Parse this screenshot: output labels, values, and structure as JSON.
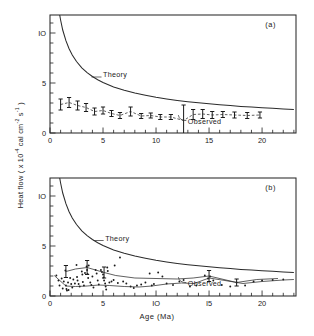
{
  "figure": {
    "ylabel_text": "Heat flow ( x 10",
    "ylabel_exp1": "-4",
    "ylabel_mid": " cal cm",
    "ylabel_exp2": "-2",
    "ylabel_mid2": " s",
    "ylabel_exp3": "-1",
    "ylabel_end": " )",
    "ylabel_full": "Heat flow ( x 10-4 cal cm-2 s-1 )",
    "xlabel": "Age (Ma)",
    "caption": ""
  },
  "chart_data": [
    {
      "type": "line",
      "panel_label": "(a)",
      "title": "",
      "xlabel": "Age (Ma)",
      "ylabel": "Heat flow ( x 10^-4 cal cm^-2 s^-1 )",
      "xlim": [
        0,
        23.2
      ],
      "ylim": [
        0,
        11.8
      ],
      "xticks": [
        0,
        5,
        10,
        15,
        20
      ],
      "xtick_labels": [
        "0",
        "5",
        "10",
        "15",
        "20"
      ],
      "xminor_step": 1,
      "yticks": [
        0,
        5,
        10
      ],
      "ytick_labels": [
        "0",
        "5",
        "IO"
      ],
      "yminor_step": 1,
      "grid": false,
      "legend_position": "inline-annotation",
      "annotations": [
        {
          "text": "Theory",
          "x": 5.0,
          "y": 5.6
        },
        {
          "text": "Observed",
          "x": 13.0,
          "y": 0.95
        },
        {
          "text": "(a)",
          "x": 20.8,
          "y": 10.6
        }
      ],
      "series": [
        {
          "name": "Theory",
          "kind": "curve",
          "note": "half-space cooling q = 11.3 / sqrt(t)",
          "coefficient": 11.3,
          "x": [
            0.9,
            1.0,
            1.2,
            1.5,
            1.8,
            2.1,
            2.5,
            3.0,
            3.5,
            4.0,
            4.5,
            5.0,
            6.0,
            7.0,
            8.0,
            9.0,
            10.0,
            11.0,
            12.0,
            13.0,
            14.0,
            15.0,
            16.0,
            17.0,
            18.0,
            19.0,
            20.0,
            21.0,
            22.0,
            23.0
          ],
          "y": [
            11.9,
            11.3,
            10.3,
            9.23,
            8.43,
            7.8,
            7.15,
            6.52,
            6.04,
            5.65,
            5.33,
            5.05,
            4.61,
            4.27,
            3.99,
            3.77,
            3.57,
            3.41,
            3.26,
            3.13,
            3.02,
            2.92,
            2.83,
            2.74,
            2.66,
            2.59,
            2.53,
            2.47,
            2.41,
            2.36
          ]
        },
        {
          "name": "Observed",
          "kind": "errorbar-line",
          "x": [
            1.0,
            1.8,
            2.6,
            3.4,
            4.2,
            5.0,
            5.8,
            6.6,
            7.6,
            8.6,
            9.5,
            10.4,
            11.4,
            12.6,
            13.5,
            14.4,
            15.3,
            16.3,
            17.4,
            18.6,
            19.8
          ],
          "y": [
            2.85,
            3.05,
            2.75,
            2.55,
            2.15,
            2.25,
            1.95,
            1.75,
            2.15,
            1.7,
            1.75,
            1.6,
            1.6,
            1.25,
            1.85,
            1.9,
            1.8,
            1.85,
            1.8,
            1.75,
            1.8
          ],
          "yerr": [
            0.55,
            0.5,
            0.45,
            0.4,
            0.35,
            0.35,
            0.3,
            0.3,
            0.45,
            0.25,
            0.25,
            0.25,
            0.25,
            1.55,
            0.5,
            0.45,
            0.35,
            0.3,
            0.3,
            0.3,
            0.3
          ]
        }
      ]
    },
    {
      "type": "scatter",
      "panel_label": "(b)",
      "title": "",
      "xlabel": "Age (Ma)",
      "ylabel": "Heat flow ( x 10^-4 cal cm^-2 s^-1 )",
      "xlim": [
        0,
        23.2
      ],
      "ylim": [
        0,
        11.8
      ],
      "xticks": [
        0,
        5,
        10,
        15,
        20
      ],
      "xtick_labels": [
        "0",
        "5",
        "IO",
        "I5",
        "20"
      ],
      "xminor_step": 1,
      "yticks": [
        0,
        5,
        10
      ],
      "ytick_labels": [
        "0",
        "5",
        "IO"
      ],
      "yminor_step": 1,
      "grid": false,
      "legend_position": "inline-annotation",
      "annotations": [
        {
          "text": "Theory",
          "x": 5.2,
          "y": 5.55
        },
        {
          "text": "Observed",
          "x": 13.0,
          "y": 1.05
        },
        {
          "text": "(b)",
          "x": 20.8,
          "y": 10.6
        }
      ],
      "series": [
        {
          "name": "Theory",
          "kind": "curve",
          "note": "half-space cooling q = 11.3 / sqrt(t)",
          "coefficient": 11.3,
          "x": [
            0.9,
            1.0,
            1.2,
            1.5,
            1.8,
            2.1,
            2.5,
            3.0,
            3.5,
            4.0,
            4.5,
            5.0,
            6.0,
            7.0,
            8.0,
            9.0,
            10.0,
            11.0,
            12.0,
            13.0,
            14.0,
            15.0,
            16.0,
            17.0,
            18.0,
            19.0,
            20.0,
            21.0,
            22.0,
            23.0
          ],
          "y": [
            11.9,
            11.3,
            10.3,
            9.23,
            8.43,
            7.8,
            7.15,
            6.52,
            6.04,
            5.65,
            5.33,
            5.05,
            4.61,
            4.27,
            3.99,
            3.77,
            3.57,
            3.41,
            3.26,
            3.13,
            3.02,
            2.92,
            2.83,
            2.74,
            2.66,
            2.59,
            2.53,
            2.47,
            2.41,
            2.36
          ]
        },
        {
          "name": "Individual measurements",
          "kind": "points",
          "points": [
            [
              0.6,
              2.05
            ],
            [
              0.8,
              1.55
            ],
            [
              0.9,
              1.05
            ],
            [
              1.1,
              1.75
            ],
            [
              1.2,
              0.75
            ],
            [
              1.3,
              1.45
            ],
            [
              1.45,
              2.55
            ],
            [
              1.5,
              1.05
            ],
            [
              1.55,
              0.7
            ],
            [
              1.6,
              0.55
            ],
            [
              1.7,
              1.35
            ],
            [
              1.75,
              0.6
            ],
            [
              1.9,
              1.8
            ],
            [
              2.0,
              1.2
            ],
            [
              2.1,
              0.85
            ],
            [
              2.2,
              1.65
            ],
            [
              2.35,
              1.25
            ],
            [
              2.5,
              3.1
            ],
            [
              2.55,
              1.9
            ],
            [
              2.6,
              1.55
            ],
            [
              2.7,
              1.2
            ],
            [
              2.8,
              0.95
            ],
            [
              3.0,
              2.45
            ],
            [
              3.05,
              2.15
            ],
            [
              3.1,
              1.4
            ],
            [
              3.2,
              1.05
            ],
            [
              3.3,
              2.3
            ],
            [
              3.45,
              2.95
            ],
            [
              3.5,
              2.6
            ],
            [
              3.55,
              2.2
            ],
            [
              3.6,
              1.8
            ],
            [
              3.65,
              3.05
            ],
            [
              3.8,
              1.35
            ],
            [
              3.9,
              1.1
            ],
            [
              4.0,
              1.95
            ],
            [
              4.1,
              0.85
            ],
            [
              4.3,
              2.6
            ],
            [
              4.4,
              2.25
            ],
            [
              4.5,
              1.55
            ],
            [
              4.6,
              1.15
            ],
            [
              4.8,
              2.6
            ],
            [
              4.9,
              2.4
            ],
            [
              5.0,
              2.15
            ],
            [
              5.05,
              1.85
            ],
            [
              5.1,
              1.55
            ],
            [
              5.2,
              1.25
            ],
            [
              5.25,
              0.95
            ],
            [
              5.3,
              0.65
            ],
            [
              5.4,
              2.85
            ],
            [
              5.45,
              2.5
            ],
            [
              5.6,
              1.35
            ],
            [
              5.8,
              1.45
            ],
            [
              6.0,
              1.6
            ],
            [
              6.1,
              3.05
            ],
            [
              6.4,
              1.3
            ],
            [
              6.6,
              3.85
            ],
            [
              6.9,
              1.45
            ],
            [
              7.2,
              1.25
            ],
            [
              7.6,
              0.95
            ],
            [
              7.9,
              0.8
            ],
            [
              8.2,
              1.05
            ],
            [
              8.6,
              1.15
            ],
            [
              9.0,
              1.35
            ],
            [
              9.4,
              2.25
            ],
            [
              9.6,
              1.05
            ],
            [
              9.8,
              1.2
            ],
            [
              10.2,
              2.35
            ],
            [
              10.6,
              1.95
            ],
            [
              11.0,
              1.25
            ],
            [
              11.6,
              1.1
            ],
            [
              12.2,
              1.45
            ],
            [
              12.6,
              1.6
            ],
            [
              13.2,
              0.95
            ],
            [
              13.8,
              1.05
            ],
            [
              14.6,
              2.05
            ],
            [
              14.9,
              1.75
            ],
            [
              15.1,
              1.95
            ],
            [
              15.4,
              1.55
            ],
            [
              16.2,
              1.1
            ],
            [
              17.0,
              0.95
            ],
            [
              17.6,
              1.35
            ],
            [
              18.4,
              1.05
            ],
            [
              19.2,
              1.45
            ],
            [
              20.0,
              1.55
            ],
            [
              21.0,
              1.6
            ],
            [
              22.0,
              1.65
            ]
          ]
        },
        {
          "name": "Observed mean (upper envelope)",
          "kind": "errorbar-line",
          "x": [
            1.5,
            2.4,
            3.5,
            5.1,
            6.2,
            8.0,
            10.0,
            12.0,
            13.5,
            15.0,
            17.6,
            19.5,
            21.5
          ],
          "y": [
            2.45,
            2.7,
            2.85,
            2.35,
            2.05,
            1.8,
            1.75,
            1.7,
            1.8,
            2.0,
            1.35,
            1.65,
            1.75
          ],
          "yerr": [
            0.6,
            0.0,
            0.7,
            0.55,
            0.0,
            0.0,
            0.0,
            0.0,
            0.0,
            0.55,
            0.35,
            0.0,
            0.0
          ]
        },
        {
          "name": "Observed mean (lower envelope)",
          "kind": "line",
          "x": [
            0.4,
            1.5,
            2.4,
            3.5,
            4.6,
            5.6,
            7.0,
            8.4,
            9.6,
            11.0,
            12.4,
            13.6,
            15.0,
            16.5,
            18.2,
            20.0,
            22.0,
            23.0
          ],
          "y": [
            2.05,
            1.0,
            0.95,
            1.0,
            1.1,
            1.05,
            0.95,
            0.9,
            1.0,
            1.2,
            1.3,
            1.25,
            1.8,
            1.55,
            1.25,
            1.45,
            1.6,
            1.65
          ]
        }
      ]
    }
  ]
}
